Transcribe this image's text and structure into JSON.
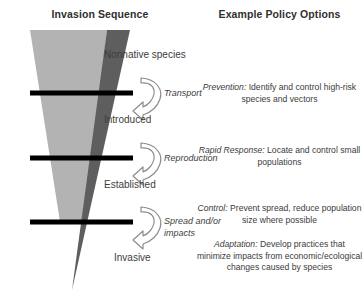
{
  "figure": {
    "title_left": "Invasion Sequence",
    "title_right": "Example Policy Options",
    "colors": {
      "outer_wedge": "#b3b3b3",
      "inner_wedge": "#5e5e5e",
      "barrier": "#000000",
      "arrow_stroke": "#8c8c8c",
      "arrow_fill": "#ffffff",
      "text": "#3b3b3b"
    }
  },
  "stages": [
    {
      "label": "Nonnative species"
    },
    {
      "label": "Introduced"
    },
    {
      "label": "Established"
    },
    {
      "label": "Invasive"
    }
  ],
  "transitions": [
    {
      "label": "Transport"
    },
    {
      "label": "Reproduction"
    },
    {
      "label": "Spread and/or",
      "label2": "impacts"
    }
  ],
  "barriers": [
    {
      "name": "barrier-transport"
    },
    {
      "name": "barrier-reproduction"
    },
    {
      "name": "barrier-spread"
    }
  ],
  "policies": [
    {
      "lead": "Prevention:",
      "body": " Identify and control high-risk species and vectors"
    },
    {
      "lead": "Rapid Response:",
      "body": " Locate and control small populations"
    },
    {
      "lead": "Control:",
      "body": " Prevent spread, reduce population size where possible"
    },
    {
      "lead": "Adaptation:",
      "body": " Develop practices that minimize impacts from economic/ecological changes caused by species"
    }
  ]
}
